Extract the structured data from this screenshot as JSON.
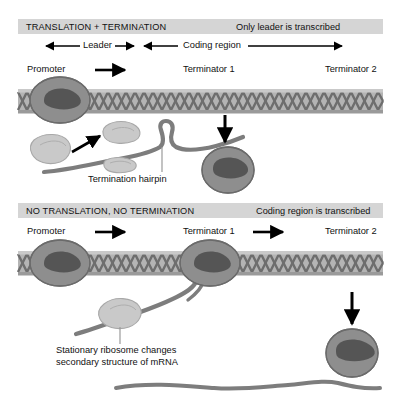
{
  "figure": {
    "type": "biology-diagram",
    "colors": {
      "header_bar": "#d5d5d5",
      "dna_band": "#b4b4b4",
      "dna_helix": "#6e6e6e",
      "polymerase_body": "#8e8e8e",
      "polymerase_cleft": "#555555",
      "ribosome_subunit": "#c9c9c9",
      "mrna": "#7d7d7d",
      "arrow": "#000000",
      "text": "#111111"
    }
  },
  "panels": [
    {
      "id": "translation-termination",
      "header": {
        "title": "TRANSLATION + TERMINATION",
        "note": "Only leader is transcribed"
      },
      "regions": [
        {
          "name": "leader",
          "label": "Leader"
        },
        {
          "name": "coding-region",
          "label": "Coding region"
        }
      ],
      "sites": [
        {
          "name": "promoter",
          "label": "Promoter",
          "has_arrow": true
        },
        {
          "name": "terminator-1",
          "label": "Terminator 1",
          "has_arrow": false
        },
        {
          "name": "terminator-2",
          "label": "Terminator 2",
          "has_arrow": false
        }
      ],
      "annotations": [
        {
          "name": "termination-hairpin",
          "label": "Termination hairpin"
        }
      ]
    },
    {
      "id": "no-translation-no-termination",
      "header": {
        "title": "NO TRANSLATION, NO TERMINATION",
        "note": "Coding region is transcribed"
      },
      "sites": [
        {
          "name": "promoter",
          "label": "Promoter",
          "has_arrow": true
        },
        {
          "name": "terminator-1",
          "label": "Terminator 1",
          "has_arrow": true
        },
        {
          "name": "terminator-2",
          "label": "Terminator 2",
          "has_arrow": false
        }
      ],
      "annotations": [
        {
          "name": "stationary-ribosome",
          "label_line_1": "Stationary ribosome changes",
          "label_line_2": "secondary structure of mRNA"
        }
      ]
    }
  ]
}
